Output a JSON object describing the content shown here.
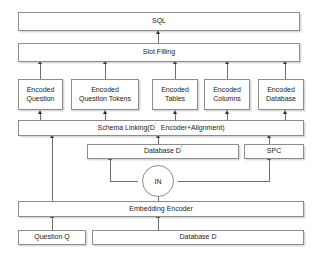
{
  "diagram": {
    "style": {
      "box_border_color": "#8c8c8c",
      "box_fill_color": "#ffffff",
      "line_color": "#6e6e6e",
      "arrow_color": "#2e2e2e",
      "text_color": "#1a1a1a",
      "background": "#ffffff"
    },
    "nodes": {
      "sql": {
        "label": "SQL"
      },
      "slot_filling": {
        "label": "Slot Filling"
      },
      "encoded_question": {
        "line1": "Encoded",
        "line2": "Question"
      },
      "encoded_question_tokens": {
        "line1": "Encoded",
        "line2": "Question Tokens"
      },
      "encoded_tables": {
        "line1": "Encoded",
        "line2": "Tables"
      },
      "encoded_columns": {
        "line1": "Encoded",
        "line2": "Columns"
      },
      "encoded_database": {
        "line1": "Encoded",
        "line2": "Database"
      },
      "schema_linking": {
        "prefix": "Schema Linking(D",
        "prime": "'",
        "suffix": "Encoder+Alignment)"
      },
      "database_d_prime": {
        "prefix": "Database D",
        "prime": "'"
      },
      "spc": {
        "label": "SPC"
      },
      "in_node": {
        "label": "IN"
      },
      "embedding_encoder": {
        "label": "Embedding Encoder"
      },
      "question_q": {
        "label": "Question Q"
      },
      "database_d": {
        "label": "Database D"
      }
    }
  }
}
